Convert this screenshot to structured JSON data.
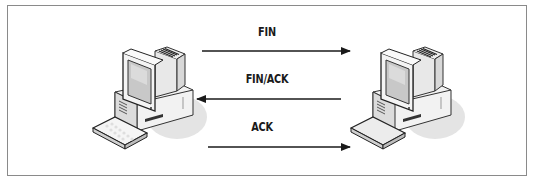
{
  "diagram": {
    "type": "tcp-connection-teardown",
    "frame_color": "#8a8a8a",
    "arrow_color": "#1a1a1a",
    "nodes": [
      {
        "id": "left-computer",
        "icon": "desktop-computer-icon"
      },
      {
        "id": "right-computer",
        "icon": "desktop-computer-icon"
      }
    ],
    "messages": [
      {
        "label": "FIN",
        "direction": "left-to-right"
      },
      {
        "label": "FIN/ACK",
        "direction": "right-to-left"
      },
      {
        "label": "ACK",
        "direction": "left-to-right"
      }
    ]
  }
}
